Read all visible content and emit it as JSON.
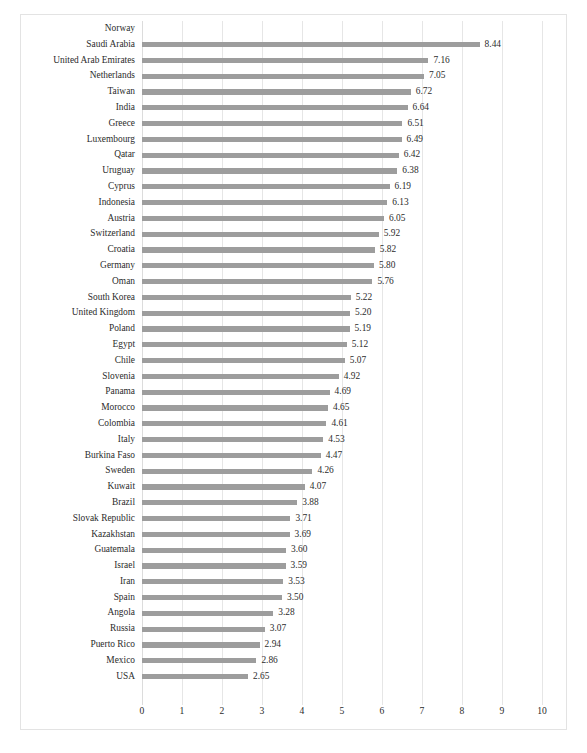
{
  "chart_data": {
    "type": "bar",
    "orientation": "horizontal",
    "title": "",
    "subtitle": "",
    "xlabel": "",
    "ylabel": "",
    "xlim": [
      0,
      10
    ],
    "xticks": [
      "0",
      "1",
      "2",
      "3",
      "4",
      "5",
      "6",
      "7",
      "8",
      "9",
      "10"
    ],
    "grid": true,
    "legend": null,
    "bar_color": "#9d9d9d",
    "text_color": "#2b2b2b",
    "gridline_color": "#e6e6e6",
    "border_color": "#e3e3e3",
    "categories": [
      "Norway",
      "Saudi Arabia",
      "United Arab Emirates",
      "Netherlands",
      "Taiwan",
      "India",
      "Greece",
      "Luxembourg",
      "Qatar",
      "Uruguay",
      "Cyprus",
      "Indonesia",
      "Austria",
      "Switzerland",
      "Croatia",
      "Germany",
      "Oman",
      "South Korea",
      "United Kingdom",
      "Poland",
      "Egypt",
      "Chile",
      "Slovenia",
      "Panama",
      "Morocco",
      "Colombia",
      "Italy",
      "Burkina Faso",
      "Sweden",
      "Kuwait",
      "Brazil",
      "Slovak Republic",
      "Kazakhstan",
      "Guatemala",
      "Israel",
      "Iran",
      "Spain",
      "Angola",
      "Russia",
      "Puerto Rico",
      "Mexico",
      "USA"
    ],
    "values": [
      null,
      8.44,
      7.16,
      7.05,
      6.72,
      6.64,
      6.51,
      6.49,
      6.42,
      6.38,
      6.19,
      6.13,
      6.05,
      5.92,
      5.82,
      5.8,
      5.76,
      5.22,
      5.2,
      5.19,
      5.12,
      5.07,
      4.92,
      4.69,
      4.65,
      4.61,
      4.53,
      4.47,
      4.26,
      4.07,
      3.88,
      3.71,
      3.69,
      3.6,
      3.59,
      3.53,
      3.5,
      3.28,
      3.07,
      2.94,
      2.86,
      2.65
    ],
    "value_labels": [
      "",
      "8.44",
      "7.16",
      "7.05",
      "6.72",
      "6.64",
      "6.51",
      "6.49",
      "6.42",
      "6.38",
      "6.19",
      "6.13",
      "6.05",
      "5.92",
      "5.82",
      "5.80",
      "5.76",
      "5.22",
      "5.20",
      "5.19",
      "5.12",
      "5.07",
      "4.92",
      "4.69",
      "4.65",
      "4.61",
      "4.53",
      "4.47",
      "4.26",
      "4.07",
      "3.88",
      "3.71",
      "3.69",
      "3.60",
      "3.59",
      "3.53",
      "3.50",
      "3.28",
      "3.07",
      "2.94",
      "2.86",
      "2.65"
    ]
  }
}
